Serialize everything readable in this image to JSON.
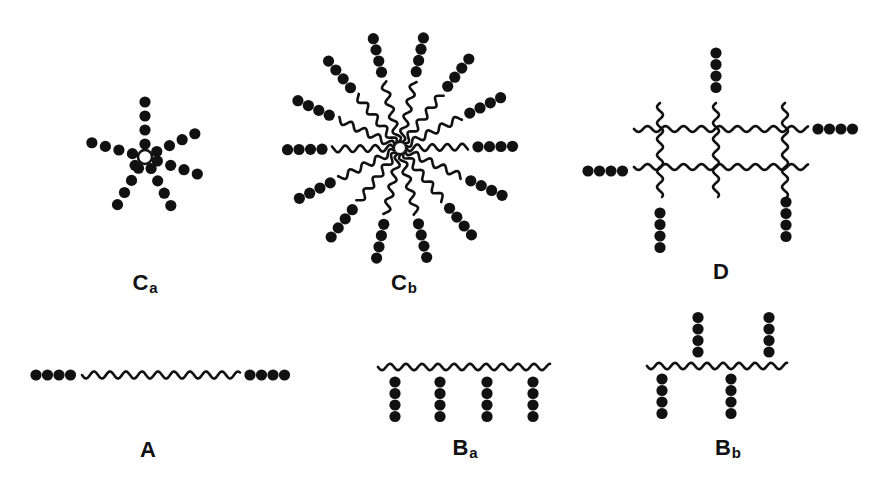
{
  "colors": {
    "ink": "#111111",
    "background": "#ffffff"
  },
  "structures": {
    "Ca": {
      "label_main": "C",
      "label_sub": "a",
      "label_pos": [
        145,
        283
      ],
      "description": "star with small core, 7 bead arms",
      "center": [
        145,
        157
      ],
      "core_radius": 7,
      "arms": [
        {
          "angle": -90,
          "beads": 4
        },
        {
          "angle": -25,
          "beads": 4
        },
        {
          "angle": 18,
          "beads": 4
        },
        {
          "angle": 62,
          "beads": 4
        },
        {
          "angle": 120,
          "beads": 4
        },
        {
          "angle": 140,
          "beads": 1
        },
        {
          "angle": 195,
          "beads": 4
        }
      ]
    },
    "Cb": {
      "label_main": "C",
      "label_sub": "b",
      "label_pos": [
        404,
        283
      ],
      "description": "star with 14 wavy spacer arms ending in 4-bead blocks",
      "center": [
        400,
        148
      ],
      "arm_count": 14,
      "beads_per_arm": 4,
      "inner_radius": 6,
      "spacer_length": 62,
      "block_length": 44
    },
    "D": {
      "label_main": "D",
      "label_sub": "",
      "label_pos": [
        721,
        272
      ],
      "description": "crosslinked network with pendant bead blocks",
      "rows_y": [
        129,
        167
      ],
      "cols_x": [
        660,
        716,
        785
      ],
      "x_range": [
        634,
        808
      ],
      "bead_blocks": [
        {
          "x": 716,
          "y0": 53,
          "dir": "down",
          "beads": 4
        },
        {
          "x": 818,
          "y0": 129,
          "dir": "right",
          "beads": 4
        },
        {
          "x": 588,
          "y0": 171,
          "dir": "right",
          "beads": 4
        },
        {
          "x": 660,
          "y0": 213,
          "dir": "down",
          "beads": 4
        },
        {
          "x": 786,
          "y0": 202,
          "dir": "down",
          "beads": 4
        }
      ]
    },
    "A": {
      "label_main": "A",
      "label_sub": "",
      "label_pos": [
        148,
        450
      ],
      "description": "linear triblock: beads - wavy chain - beads",
      "y": 375,
      "left_beads_x": 36,
      "wave_x": [
        82,
        240
      ],
      "right_beads_x": 250,
      "beads_each_side": 4
    },
    "Ba": {
      "label_main": "B",
      "label_sub": "a",
      "label_pos": [
        465,
        448
      ],
      "description": "comb: wavy backbone with 4 pendant 4-bead blocks",
      "backbone_y": 367,
      "backbone_x": [
        378,
        550
      ],
      "pendants_x": [
        395,
        440,
        487,
        533
      ],
      "beads_per_pendant": 4
    },
    "Bb": {
      "label_main": "B",
      "label_sub": "b",
      "label_pos": [
        728,
        448
      ],
      "description": "alternating graft: pendants above and below backbone",
      "backbone_y": 366,
      "backbone_x": [
        647,
        787
      ],
      "pendants": [
        {
          "x": 662,
          "dir": "down",
          "beads": 4
        },
        {
          "x": 698,
          "dir": "up",
          "beads": 4
        },
        {
          "x": 731,
          "dir": "down",
          "beads": 4
        },
        {
          "x": 769,
          "dir": "up",
          "beads": 4
        }
      ]
    }
  }
}
